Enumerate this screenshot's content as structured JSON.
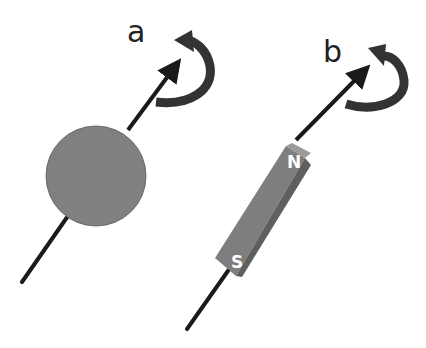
{
  "figure": {
    "panels": [
      {
        "id": "a",
        "label": "a",
        "object": "sphere",
        "axis": "rotation-axis-arrow",
        "rotation": "curved-rotation-arrow"
      },
      {
        "id": "b",
        "label": "b",
        "object": "bar-magnet",
        "poles": {
          "north": "N",
          "south": "S"
        },
        "axis": "rotation-axis-arrow",
        "rotation": "curved-rotation-arrow"
      }
    ],
    "colors": {
      "background": "#ffffff",
      "object_fill": "#808080",
      "object_dark": "#5f5f5f",
      "object_light": "#9a9a9a",
      "arrow": "#1a1a1a",
      "rotation_arrow": "#333333",
      "pole_text": "#ffffff"
    }
  }
}
